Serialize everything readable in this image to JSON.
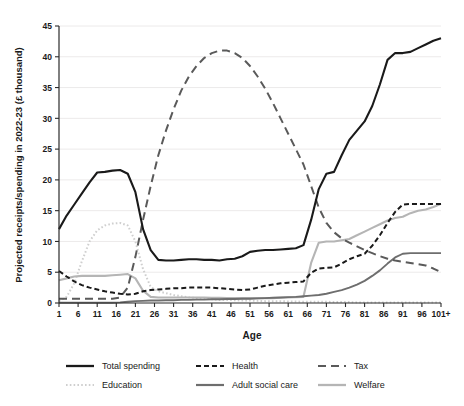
{
  "chart_data": {
    "type": "line",
    "title": "",
    "xlabel": "Age",
    "ylabel": "Projected receipts/spending in 2022-23 (£ thousand)",
    "xlim": [
      1,
      101
    ],
    "ylim": [
      0,
      45
    ],
    "yticks": [
      0,
      5,
      10,
      15,
      20,
      25,
      30,
      35,
      40,
      45
    ],
    "xticks": [
      "1",
      "6",
      "11",
      "16",
      "21",
      "26",
      "31",
      "36",
      "41",
      "46",
      "51",
      "56",
      "61",
      "66",
      "71",
      "76",
      "81",
      "86",
      "91",
      "96",
      "101+"
    ],
    "xtick_values": [
      1,
      6,
      11,
      16,
      21,
      26,
      31,
      36,
      41,
      46,
      51,
      56,
      61,
      66,
      71,
      76,
      81,
      86,
      91,
      96,
      101
    ],
    "grid": "horizontal",
    "legend_position": "bottom",
    "x": [
      1,
      3,
      5,
      7,
      9,
      11,
      13,
      15,
      17,
      19,
      21,
      23,
      25,
      27,
      29,
      31,
      33,
      35,
      37,
      39,
      41,
      43,
      45,
      47,
      49,
      51,
      53,
      55,
      57,
      59,
      61,
      63,
      65,
      67,
      69,
      71,
      73,
      75,
      77,
      79,
      81,
      83,
      85,
      87,
      89,
      91,
      93,
      95,
      97,
      99,
      101
    ],
    "series": [
      {
        "name": "Total spending",
        "color": "#1a1a1a",
        "width": 2.1,
        "dash": "none",
        "values": [
          12.0,
          14.2,
          16.0,
          17.8,
          19.6,
          21.2,
          21.3,
          21.5,
          21.6,
          21.0,
          18.0,
          12.0,
          8.6,
          7.0,
          6.9,
          6.9,
          7.0,
          7.1,
          7.1,
          7.0,
          7.0,
          6.9,
          7.1,
          7.2,
          7.6,
          8.3,
          8.5,
          8.6,
          8.6,
          8.7,
          8.8,
          8.9,
          9.4,
          13.5,
          18.5,
          21.0,
          21.3,
          24.0,
          26.5,
          28.0,
          29.5,
          32.0,
          35.5,
          39.5,
          40.6,
          40.6,
          40.8,
          41.4,
          42.0,
          42.6,
          43.0
        ]
      },
      {
        "name": "Health",
        "color": "#1a1a1a",
        "width": 2.0,
        "dash": "5,3",
        "values": [
          5.2,
          4.3,
          3.5,
          2.9,
          2.5,
          2.2,
          1.9,
          1.7,
          1.5,
          1.4,
          1.5,
          1.9,
          2.1,
          2.2,
          2.3,
          2.4,
          2.4,
          2.5,
          2.5,
          2.5,
          2.5,
          2.4,
          2.3,
          2.2,
          2.1,
          2.2,
          2.5,
          2.8,
          3.0,
          3.2,
          3.3,
          3.4,
          3.5,
          4.9,
          5.6,
          5.7,
          5.8,
          6.4,
          7.1,
          7.6,
          8.0,
          9.3,
          11.0,
          13.0,
          14.8,
          16.0,
          16.1,
          16.1,
          16.1,
          16.1,
          16.1
        ]
      },
      {
        "name": "Tax",
        "color": "#5a5a5a",
        "width": 2.0,
        "dash": "8,5",
        "values": [
          0.7,
          0.7,
          0.7,
          0.7,
          0.7,
          0.7,
          0.7,
          0.7,
          0.9,
          2.5,
          7.5,
          13.5,
          19.0,
          24.0,
          28.0,
          31.5,
          34.5,
          36.8,
          38.5,
          39.8,
          40.6,
          41.0,
          41.0,
          40.6,
          39.8,
          38.5,
          36.8,
          34.8,
          32.5,
          30.0,
          27.5,
          25.0,
          22.5,
          19.0,
          15.5,
          13.0,
          11.5,
          10.5,
          9.8,
          9.2,
          8.6,
          8.1,
          7.6,
          7.2,
          6.9,
          6.7,
          6.5,
          6.3,
          6.1,
          5.6,
          5.0
        ]
      },
      {
        "name": "Education",
        "color": "#cfcfcf",
        "width": 2.0,
        "dash": "1.6,2.2",
        "values": [
          0.3,
          1.0,
          3.2,
          6.8,
          10.0,
          11.8,
          12.6,
          12.9,
          13.0,
          12.6,
          10.0,
          5.5,
          2.6,
          1.9,
          1.6,
          1.3,
          1.1,
          0.9,
          0.8,
          0.7,
          0.6,
          0.5,
          0.5,
          0.45,
          0.4,
          0.4,
          0.35,
          0.3,
          0.3,
          0.3,
          0.25,
          0.25,
          0.2,
          0.2,
          0.2,
          0.2,
          0.15,
          0.15,
          0.15,
          0.1,
          0.1,
          0.1,
          0.1,
          0.1,
          0.1,
          0.1,
          0.1,
          0.1,
          0.1,
          0.1,
          0.1
        ]
      },
      {
        "name": "Adult social care",
        "color": "#6e6e6e",
        "width": 1.9,
        "dash": "none",
        "values": [
          0.05,
          0.05,
          0.05,
          0.05,
          0.05,
          0.05,
          0.05,
          0.05,
          0.1,
          0.2,
          0.3,
          0.35,
          0.4,
          0.4,
          0.45,
          0.45,
          0.5,
          0.5,
          0.55,
          0.55,
          0.6,
          0.6,
          0.65,
          0.65,
          0.7,
          0.7,
          0.75,
          0.8,
          0.85,
          0.9,
          0.95,
          1.0,
          1.1,
          1.2,
          1.3,
          1.5,
          1.8,
          2.1,
          2.5,
          3.0,
          3.6,
          4.4,
          5.3,
          6.4,
          7.4,
          8.0,
          8.1,
          8.1,
          8.1,
          8.1,
          8.1
        ]
      },
      {
        "name": "Welfare",
        "color": "#b5b5b5",
        "width": 2.1,
        "dash": "none",
        "values": [
          3.7,
          4.0,
          4.3,
          4.4,
          4.4,
          4.4,
          4.4,
          4.5,
          4.6,
          4.7,
          4.0,
          2.0,
          1.0,
          0.9,
          0.9,
          0.9,
          0.9,
          0.9,
          0.9,
          0.9,
          0.85,
          0.85,
          0.8,
          0.8,
          0.8,
          0.8,
          0.8,
          0.8,
          0.8,
          0.85,
          0.9,
          0.95,
          1.0,
          6.5,
          9.8,
          10.0,
          10.0,
          10.2,
          10.4,
          11.0,
          11.6,
          12.2,
          12.8,
          13.4,
          13.8,
          14.0,
          14.6,
          15.0,
          15.2,
          15.6,
          16.1
        ]
      }
    ],
    "legend": [
      {
        "label": "Total spending",
        "color": "#1a1a1a",
        "dash": "none",
        "width": 2.3
      },
      {
        "label": "Health",
        "color": "#1a1a1a",
        "dash": "5,3",
        "width": 2.2
      },
      {
        "label": "Tax",
        "color": "#5a5a5a",
        "dash": "8,5",
        "width": 2.2
      },
      {
        "label": "Education",
        "color": "#cfcfcf",
        "dash": "1.6,2.2",
        "width": 2.2
      },
      {
        "label": "Adult social care",
        "color": "#6e6e6e",
        "dash": "none",
        "width": 2.2
      },
      {
        "label": "Welfare",
        "color": "#b5b5b5",
        "dash": "none",
        "width": 2.3
      }
    ]
  }
}
